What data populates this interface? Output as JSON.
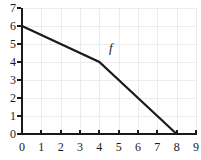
{
  "chart_data": {
    "type": "line",
    "title": "",
    "subtitle": "",
    "xlabel": "",
    "ylabel": "",
    "xlim": [
      0,
      9
    ],
    "ylim": [
      0,
      7
    ],
    "xticks": [
      0,
      1,
      2,
      3,
      4,
      5,
      6,
      7,
      8,
      9
    ],
    "yticks": [
      0,
      1,
      2,
      3,
      4,
      5,
      6,
      7
    ],
    "xtick_labels": [
      "0",
      "1",
      "2",
      "3",
      "4",
      "5",
      "6",
      "7",
      "8",
      "9"
    ],
    "ytick_labels": [
      "0",
      "1",
      "2",
      "3",
      "4",
      "5",
      "6",
      "7"
    ],
    "grid": true,
    "grid_color": "#ececec",
    "axis_color": "#1a1a1a",
    "legend": "none",
    "series": [
      {
        "name": "f",
        "label": "f",
        "color": "#1a1a1a",
        "linewidth": 2,
        "piecewise_linear": true,
        "x": [
          0,
          4,
          8
        ],
        "y": [
          6,
          4,
          0
        ],
        "points": [
          {
            "x": 0,
            "y": 6
          },
          {
            "x": 4,
            "y": 4
          },
          {
            "x": 8,
            "y": 0
          }
        ],
        "annotation": {
          "text": "f",
          "x": 4.6,
          "y": 4.8,
          "style": "italic"
        }
      }
    ]
  }
}
